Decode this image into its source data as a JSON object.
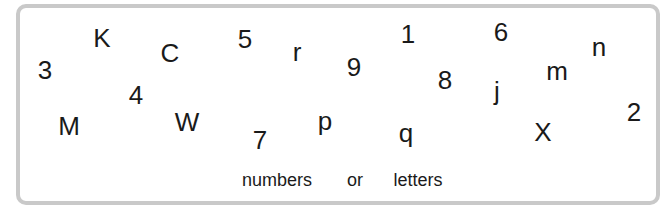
{
  "glyphs": [
    {
      "char": "3",
      "x": 45,
      "y": 70
    },
    {
      "char": "K",
      "x": 102,
      "y": 38
    },
    {
      "char": "C",
      "x": 170,
      "y": 53
    },
    {
      "char": "5",
      "x": 245,
      "y": 39
    },
    {
      "char": "r",
      "x": 297,
      "y": 52
    },
    {
      "char": "9",
      "x": 354,
      "y": 67
    },
    {
      "char": "1",
      "x": 408,
      "y": 34
    },
    {
      "char": "6",
      "x": 501,
      "y": 32
    },
    {
      "char": "n",
      "x": 599,
      "y": 47
    },
    {
      "char": "4",
      "x": 136,
      "y": 95
    },
    {
      "char": "8",
      "x": 445,
      "y": 80
    },
    {
      "char": "m",
      "x": 557,
      "y": 71
    },
    {
      "char": "j",
      "x": 497,
      "y": 91
    },
    {
      "char": "M",
      "x": 69,
      "y": 126
    },
    {
      "char": "W",
      "x": 187,
      "y": 122
    },
    {
      "char": "7",
      "x": 260,
      "y": 140
    },
    {
      "char": "p",
      "x": 325,
      "y": 121
    },
    {
      "char": "q",
      "x": 406,
      "y": 133
    },
    {
      "char": "X",
      "x": 543,
      "y": 132
    },
    {
      "char": "2",
      "x": 634,
      "y": 112
    }
  ],
  "captions": [
    {
      "text": "numbers",
      "x": 277,
      "y": 180
    },
    {
      "text": "or",
      "x": 355,
      "y": 180
    },
    {
      "text": "letters",
      "x": 418,
      "y": 180
    }
  ]
}
